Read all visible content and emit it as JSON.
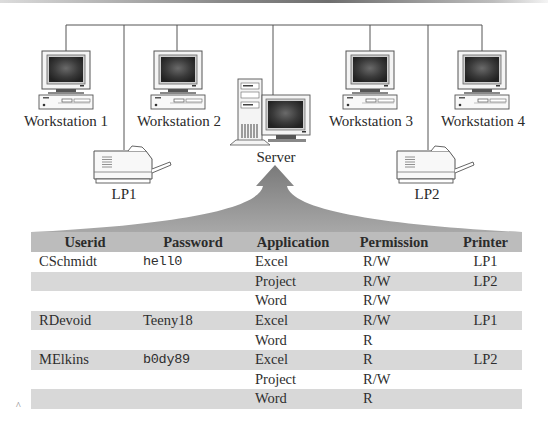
{
  "diagram": {
    "nodes": [
      {
        "id": "ws1",
        "type": "workstation",
        "label": "Workstation 1"
      },
      {
        "id": "lp1",
        "type": "printer",
        "label": "LP1"
      },
      {
        "id": "ws2",
        "type": "workstation",
        "label": "Workstation 2"
      },
      {
        "id": "server",
        "type": "server",
        "label": "Server"
      },
      {
        "id": "ws3",
        "type": "workstation",
        "label": "Workstation 3"
      },
      {
        "id": "lp2",
        "type": "printer",
        "label": "LP2"
      },
      {
        "id": "ws4",
        "type": "workstation",
        "label": "Workstation 4"
      }
    ],
    "connection": "shared bus network",
    "arrow": "table-to-server"
  },
  "labels": {
    "ws1": "Workstation 1",
    "ws2": "Workstation 2",
    "ws3": "Workstation 3",
    "ws4": "Workstation 4",
    "lp1": "LP1",
    "lp2": "LP2",
    "server": "Server"
  },
  "table": {
    "headers": {
      "userid": "Userid",
      "password": "Password",
      "application": "Application",
      "permission": "Permission",
      "printer": "Printer"
    },
    "rows": [
      {
        "userid": "CSchmidt",
        "password": "hell0",
        "application": "Excel",
        "permission": "R/W",
        "printer": "LP1"
      },
      {
        "userid": "",
        "password": "",
        "application": "Project",
        "permission": "R/W",
        "printer": "LP2"
      },
      {
        "userid": "",
        "password": "",
        "application": "Word",
        "permission": "R/W",
        "printer": ""
      },
      {
        "userid": "RDevoid",
        "password": "Teeny18",
        "application": "Excel",
        "permission": "R/W",
        "printer": "LP1"
      },
      {
        "userid": "",
        "password": "",
        "application": "Word",
        "permission": "R",
        "printer": ""
      },
      {
        "userid": "MElkins",
        "password": "b0dy89",
        "application": "Excel",
        "permission": "R",
        "printer": "LP2"
      },
      {
        "userid": "",
        "password": "",
        "application": "Project",
        "permission": "R/W",
        "printer": ""
      },
      {
        "userid": "",
        "password": "",
        "application": "Word",
        "permission": "R",
        "printer": ""
      }
    ]
  },
  "colors": {
    "header_bg": "#bcbcbc",
    "row_shaded": "#d8d8d8",
    "row_plain": "#ffffff",
    "arrow": "#8c8c8c",
    "line": "#555555"
  },
  "footnote_mark": "^"
}
